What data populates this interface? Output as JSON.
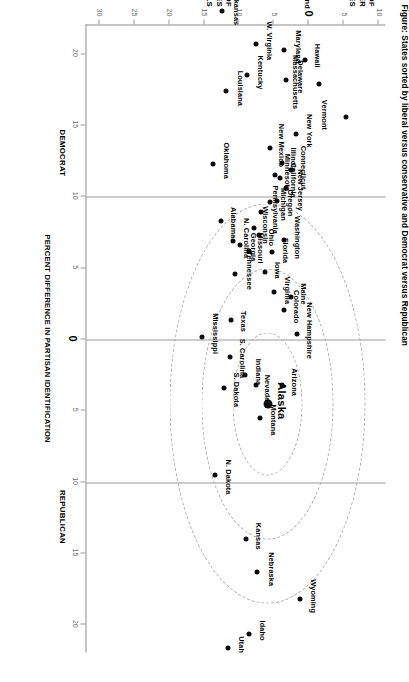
{
  "title": "Figure: States sorted by liberal versus conservative and Democrat versus Republican",
  "axes": {
    "x_axis_title": "PERCENT DIFFERENCE IN PARTISAN IDENTIFICATION",
    "x_left_label": "DEMOCRAT",
    "x_right_label": "REPUBLICAN",
    "x_ticks": [
      "20",
      "15",
      "10",
      "5",
      "0",
      "5",
      "10",
      "15",
      "20"
    ],
    "y_upper_title": "PERCENT OF\nLIBERALS OVER\nCONSERVATIVES",
    "y_lower_title": "PERCENT OF\nCONSERVATIVES\nOVER LIBERALS",
    "y_ticks": [
      "10",
      "5",
      "0",
      "5",
      "10",
      "15",
      "20",
      "25",
      "30"
    ]
  },
  "chart_data": {
    "type": "scatter",
    "title": "States sorted by liberal versus conservative and Democrat versus Republican",
    "xlabel": "PERCENT DIFFERENCE IN PARTISAN IDENTIFICATION",
    "ylabel": "PERCENT OF CONSERVATIVES OVER LIBERALS",
    "xlim": [
      -22,
      22
    ],
    "ylim": [
      -11,
      32
    ],
    "x_tick_values": [
      -20,
      -15,
      -10,
      -5,
      0,
      5,
      10,
      15,
      20
    ],
    "x_tick_labels": [
      "20",
      "15",
      "10",
      "5",
      "0",
      "5",
      "10",
      "15",
      "20"
    ],
    "y_tick_values": [
      -10,
      -5,
      0,
      5,
      10,
      15,
      20,
      25,
      30
    ],
    "y_tick_labels": [
      "10",
      "5",
      "0",
      "5",
      "10",
      "15",
      "20",
      "25",
      "30"
    ],
    "grid": false,
    "legend": "none",
    "annotations": [
      {
        "text": "DEMOCRAT",
        "x": -13,
        "y": -8.5
      },
      {
        "text": "REPUBLICAN",
        "x": 12.5,
        "y": -8.5
      }
    ],
    "rings": [
      {
        "label": "inner",
        "center_state": "Alaska",
        "radius_units": 5
      },
      {
        "label": "middle",
        "center_state": "Alaska",
        "radius_units": 9.5
      },
      {
        "label": "outer",
        "center_state": "Alaska",
        "radius_units": 14
      }
    ],
    "highlight": "Alaska",
    "points": [
      {
        "state": "Vermont",
        "x": -15.6,
        "y": -5.4,
        "lx": -2,
        "ly": 18,
        "size": "small"
      },
      {
        "state": "Massachusetts",
        "x": -17.9,
        "y": -1.5,
        "lx": -2,
        "ly": 20,
        "size": "small"
      },
      {
        "state": "Hawaii",
        "x": -19.6,
        "y": 0.5,
        "lx": -4,
        "ly": -16,
        "size": "small"
      },
      {
        "state": "Rhode Island",
        "x": -24.4,
        "y": 2.2,
        "lx": -6,
        "ly": -18,
        "size": "small"
      },
      {
        "state": "Maryland",
        "x": -20.3,
        "y": 3.5,
        "lx": -3,
        "ly": -18,
        "size": "small"
      },
      {
        "state": "Delaware",
        "x": -18.2,
        "y": 3.2,
        "lx": -3,
        "ly": -18,
        "size": "small"
      },
      {
        "state": "New York",
        "x": -14.4,
        "y": 1.8,
        "lx": -3,
        "ly": -17,
        "size": "small"
      },
      {
        "state": "Connecticut",
        "x": -11.9,
        "y": 2.6,
        "lx": -2,
        "ly": -17,
        "size": "small"
      },
      {
        "state": "New Jersey",
        "x": -10.6,
        "y": 3.2,
        "lx": 2,
        "ly": -18,
        "size": "small"
      },
      {
        "state": "Illinois",
        "x": -12.4,
        "y": 3.9,
        "lx": -3,
        "ly": -16,
        "size": "small"
      },
      {
        "state": "California",
        "x": -11.3,
        "y": 4.1,
        "lx": 2,
        "ly": -17,
        "size": "small"
      },
      {
        "state": "Minnesota",
        "x": -11.5,
        "y": 4.8,
        "lx": -3,
        "ly": -16,
        "size": "small"
      },
      {
        "state": "Oregon",
        "x": -9.7,
        "y": 4.5,
        "lx": 2,
        "ly": -17,
        "size": "small"
      },
      {
        "state": "New Mexico",
        "x": -13.4,
        "y": 5.6,
        "lx": -3,
        "ly": -16,
        "size": "small"
      },
      {
        "state": "Michigan",
        "x": -9.6,
        "y": 5.5,
        "lx": 2,
        "ly": -17,
        "size": "small"
      },
      {
        "state": "Washington",
        "x": -7.0,
        "y": 3.6,
        "lx": -2,
        "ly": -18,
        "size": "small"
      },
      {
        "state": "Florida",
        "x": -6.1,
        "y": 5.2,
        "lx": -2,
        "ly": -17,
        "size": "small"
      },
      {
        "state": "W. Virginia",
        "x": -20.7,
        "y": 7.6,
        "lx": -3,
        "ly": -18,
        "size": "small"
      },
      {
        "state": "Kentucky",
        "x": -18.5,
        "y": 8.9,
        "lx": -3,
        "ly": -18,
        "size": "small"
      },
      {
        "state": "Pennsylvania",
        "x": -8.9,
        "y": 6.8,
        "lx": -3,
        "ly": -18,
        "size": "small"
      },
      {
        "state": "Ohio",
        "x": -7.3,
        "y": 7.1,
        "lx": 2,
        "ly": -16,
        "size": "small"
      },
      {
        "state": "Wisconsin",
        "x": -7.8,
        "y": 7.9,
        "lx": -3,
        "ly": -16,
        "size": "small"
      },
      {
        "state": "Missouri",
        "x": -6.2,
        "y": 8.6,
        "lx": -3,
        "ly": -16,
        "size": "small"
      },
      {
        "state": "Iowa",
        "x": -4.7,
        "y": 6.3,
        "lx": -2,
        "ly": -17,
        "size": "small"
      },
      {
        "state": "Georgia",
        "x": -6.6,
        "y": 9.8,
        "lx": 2,
        "ly": -17,
        "size": "small"
      },
      {
        "state": "Virginia",
        "x": -3.3,
        "y": 5.0,
        "lx": -2,
        "ly": -18,
        "size": "small"
      },
      {
        "state": "Louisiana",
        "x": -17.4,
        "y": 11.8,
        "lx": -3,
        "ly": -18,
        "size": "small"
      },
      {
        "state": "Arkansas",
        "x": -23.0,
        "y": 12.4,
        "lx": -3,
        "ly": -18,
        "size": "small"
      },
      {
        "state": "Oklahoma",
        "x": -12.3,
        "y": 13.7,
        "lx": -3,
        "ly": -17,
        "size": "small"
      },
      {
        "state": "Alabama",
        "x": -8.3,
        "y": 12.6,
        "lx": 2,
        "ly": -17,
        "size": "small"
      },
      {
        "state": "N. Carolina",
        "x": -6.9,
        "y": 10.8,
        "lx": -3,
        "ly": -17,
        "size": "small"
      },
      {
        "state": "Tennessee",
        "x": -4.6,
        "y": 10.5,
        "lx": -3,
        "ly": -18,
        "size": "small"
      },
      {
        "state": "Mississippi",
        "x": -0.2,
        "y": 15.3,
        "lx": -3,
        "ly": -17,
        "size": "small"
      },
      {
        "state": "Texas",
        "x": -1.4,
        "y": 11.2,
        "lx": 2,
        "ly": -17,
        "size": "small"
      },
      {
        "state": "Maine",
        "x": -3.0,
        "y": 2.5,
        "lx": -3,
        "ly": -16,
        "size": "small"
      },
      {
        "state": "Colorado",
        "x": -2.1,
        "y": 3.5,
        "lx": -3,
        "ly": -16,
        "size": "small"
      },
      {
        "state": "New Hampshire",
        "x": -0.4,
        "y": 1.7,
        "lx": -3,
        "ly": -17,
        "size": "small"
      },
      {
        "state": "Arizona",
        "x": 3.2,
        "y": 3.9,
        "lx": -3,
        "ly": -17,
        "size": "small"
      },
      {
        "state": "Alaska",
        "x": 4.5,
        "y": 5.9,
        "lx": -3,
        "ly": -20,
        "size": "big"
      },
      {
        "state": "Nevada",
        "x": 3.2,
        "y": 7.6,
        "lx": 3,
        "ly": -16,
        "size": "small"
      },
      {
        "state": "Montana",
        "x": 5.5,
        "y": 7.0,
        "lx": 2,
        "ly": -18,
        "size": "small"
      },
      {
        "state": "Indiana",
        "x": 2.5,
        "y": 9.1,
        "lx": -3,
        "ly": -17,
        "size": "small"
      },
      {
        "state": "S. Carolina",
        "x": 1.2,
        "y": 11.3,
        "lx": 2,
        "ly": -17,
        "size": "small"
      },
      {
        "state": "S. Dakota",
        "x": 3.4,
        "y": 12.2,
        "lx": 2,
        "ly": -17,
        "size": "small"
      },
      {
        "state": "N. Dakota",
        "x": 9.5,
        "y": 13.5,
        "lx": 2,
        "ly": -18,
        "size": "small"
      },
      {
        "state": "Kansas",
        "x": 14.0,
        "y": 9.0,
        "lx": -3,
        "ly": -17,
        "size": "small"
      },
      {
        "state": "Nebraska",
        "x": 16.3,
        "y": 7.4,
        "lx": -3,
        "ly": -18,
        "size": "small"
      },
      {
        "state": "Wyoming",
        "x": 18.2,
        "y": 1.3,
        "lx": -3,
        "ly": -18,
        "size": "small"
      },
      {
        "state": "Idaho",
        "x": 20.6,
        "y": 8.5,
        "lx": -3,
        "ly": -17,
        "size": "small"
      },
      {
        "state": "Utah",
        "x": 21.6,
        "y": 11.6,
        "lx": -3,
        "ly": -18,
        "size": "small"
      }
    ]
  }
}
